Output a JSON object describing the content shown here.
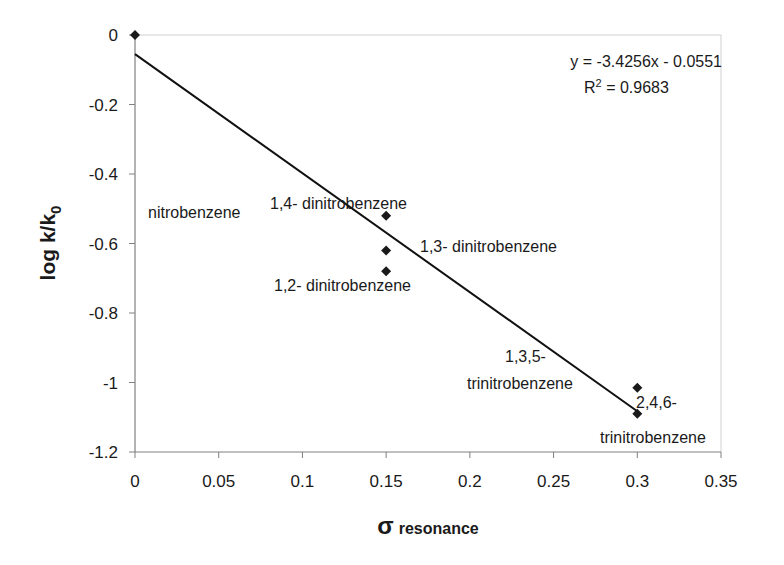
{
  "chart_data": {
    "type": "scatter",
    "title": "",
    "xlabel": "σ resonance",
    "xlabel_symbol": "σ",
    "xlabel_sub": "resonance",
    "ylabel": "log k/k0",
    "ylabel_main": "log k/k",
    "ylabel_sub": "0",
    "xlim": [
      0,
      0.35
    ],
    "ylim": [
      -1.2,
      0
    ],
    "xticks": [
      0,
      0.05,
      0.1,
      0.15,
      0.2,
      0.25,
      0.3,
      0.35
    ],
    "xtick_labels": [
      "0",
      "0.05",
      "0.1",
      "0.15",
      "0.2",
      "0.25",
      "0.3",
      "0.35"
    ],
    "yticks": [
      0,
      -0.2,
      -0.4,
      -0.6,
      -0.8,
      -1,
      -1.2
    ],
    "ytick_labels": [
      "0",
      "-0.2",
      "-0.4",
      "-0.6",
      "-0.8",
      "-1",
      "-1.2"
    ],
    "grid": false,
    "legend": "none",
    "series": [
      {
        "name": "data",
        "marker": "diamond",
        "color": "#1a1a1a",
        "points": [
          {
            "x": 0,
            "y": 0
          },
          {
            "x": 0.15,
            "y": -0.52
          },
          {
            "x": 0.15,
            "y": -0.62
          },
          {
            "x": 0.15,
            "y": -0.68
          },
          {
            "x": 0.3,
            "y": -1.015
          },
          {
            "x": 0.3,
            "y": -1.09
          }
        ]
      }
    ],
    "trendline": {
      "type": "linear",
      "slope": -3.4256,
      "intercept": -0.0551,
      "x_range": [
        0,
        0.3
      ],
      "equation_label": "y = -3.4256x - 0.0551",
      "r2_label_prefix": "R",
      "r2_label_sup": "2",
      "r2_label_value": " = 0.9683"
    },
    "annotations": [
      {
        "text": "nitrobenzene",
        "px": 148,
        "py": 218
      },
      {
        "text": "1,4- dinitrobenzene",
        "px": 270,
        "py": 209
      },
      {
        "text": "1,3- dinitrobenzene",
        "px": 420,
        "py": 252
      },
      {
        "text": "1,2- dinitrobenzene",
        "px": 274,
        "py": 291
      },
      {
        "text": "1,3,5-",
        "px": 505,
        "py": 362
      },
      {
        "text": "trinitrobenzene",
        "px": 467,
        "py": 389
      },
      {
        "text": "2,4,6-",
        "px": 636,
        "py": 408
      },
      {
        "text": "trinitrobenzene",
        "px": 600,
        "py": 443
      }
    ]
  }
}
